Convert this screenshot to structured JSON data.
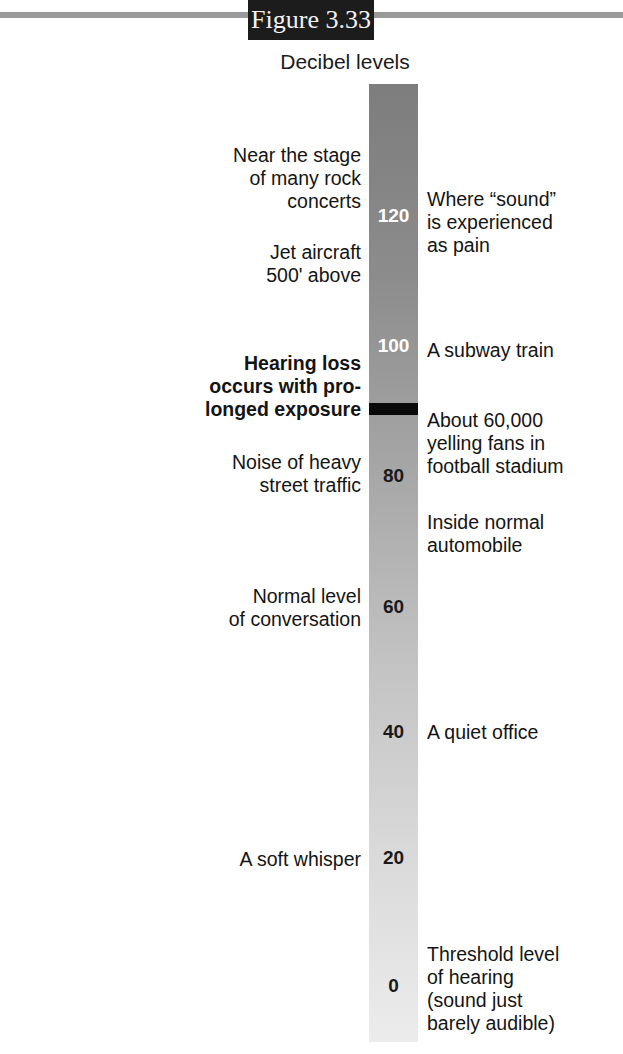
{
  "figure_label": "Figure 3.33",
  "title": "Decibel levels",
  "colors": {
    "bar_top": "#7d7d7d",
    "bar_bottom": "#ececec",
    "marker": "#0a0a0a",
    "figure_tab": "#1c1c1c",
    "rule": "#9a9a9a"
  },
  "scale": {
    "ticks": [
      "120",
      "100",
      "80",
      "60",
      "40",
      "20",
      "0"
    ],
    "unit": "decibels"
  },
  "threshold_marker": {
    "label": "Hearing loss\noccurs with pro-\nlonged exposure"
  },
  "left_labels": [
    {
      "text": "Near the stage\nof many rock\nconcerts"
    },
    {
      "text": "Jet aircraft\n500' above"
    },
    {
      "text": "Noise of heavy\nstreet traffic"
    },
    {
      "text": "Normal level\nof conversation"
    },
    {
      "text": "A soft whisper"
    }
  ],
  "right_labels": [
    {
      "text": "Where “sound”\nis experienced\nas pain"
    },
    {
      "text": "A subway train"
    },
    {
      "text": "About 60,000\nyelling fans in\nfootball stadium"
    },
    {
      "text": "Inside normal\nautomobile"
    },
    {
      "text": "A quiet office"
    },
    {
      "text": "Threshold level\nof hearing\n(sound just\nbarely audible)"
    }
  ]
}
